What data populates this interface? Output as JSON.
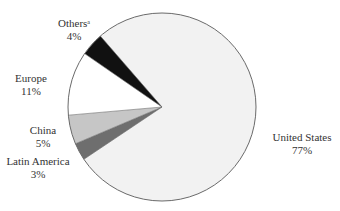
{
  "chart_data": {
    "type": "pie",
    "title": "",
    "categories": [
      "United States",
      "Latin America",
      "China",
      "Europe",
      "Others"
    ],
    "values": [
      77,
      3,
      5,
      11,
      4
    ],
    "value_labels": [
      "77%",
      "3%",
      "5%",
      "11%",
      "4%"
    ],
    "colors": [
      "#f2f2f2",
      "#6e6e6e",
      "#c6c6c6",
      "#ffffff",
      "#111111"
    ],
    "footnote_markers": {
      "Others": "a"
    },
    "outline_color": "#6a6a6a",
    "start_angle_deg": 131,
    "direction": "clockwise",
    "center": [
      162,
      107
    ],
    "radius": 94,
    "legend": "none (direct labels)"
  },
  "labels": [
    {
      "name": "United States",
      "value": "77%",
      "x": 302,
      "y": 131
    },
    {
      "name": "Latin America",
      "value": "3%",
      "x": 38,
      "y": 155
    },
    {
      "name": "China",
      "value": "5%",
      "x": 43,
      "y": 125
    },
    {
      "name": "Europe",
      "value": "11%",
      "x": 31,
      "y": 72
    },
    {
      "name": "Others",
      "sup": "a",
      "value": "4%",
      "x": 74,
      "y": 18
    }
  ]
}
